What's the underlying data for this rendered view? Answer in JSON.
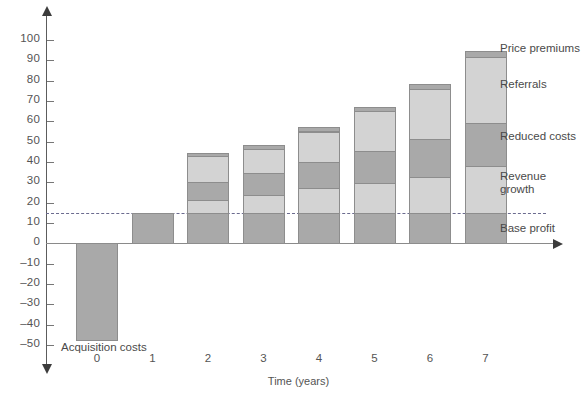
{
  "chart_data": {
    "type": "bar",
    "title": "",
    "subtitle": "",
    "xlabel": "Time (years)",
    "ylabel": "",
    "categories": [
      "0",
      "1",
      "2",
      "3",
      "4",
      "5",
      "6",
      "7"
    ],
    "ylim": [
      -50,
      100
    ],
    "yticks": [
      100,
      90,
      80,
      70,
      60,
      50,
      40,
      30,
      20,
      10,
      0,
      -10,
      -20,
      -30,
      -40,
      -50
    ],
    "ytick_labels": [
      "100",
      "90",
      "80",
      "70",
      "60",
      "50",
      "40",
      "30",
      "20",
      "10",
      "0",
      "–10",
      "–20",
      "–30",
      "–40",
      "–50"
    ],
    "grid": false,
    "legend_position": "right-annotations",
    "stacked": true,
    "reference_line": {
      "value": 15,
      "style": "dashed",
      "color": "#6b6b8f"
    },
    "series": [
      {
        "name": "Acquisition costs",
        "color": "#a9a9a9",
        "values": [
          -48,
          0,
          0,
          0,
          0,
          0,
          0,
          0
        ]
      },
      {
        "name": "Base profit",
        "color": "#a9a9a9",
        "values": [
          0,
          15,
          15,
          15,
          15,
          15,
          15,
          15
        ]
      },
      {
        "name": "Revenue growth",
        "color": "#d3d3d3",
        "values": [
          0,
          0,
          6.5,
          9,
          12,
          14.5,
          17.5,
          23
        ]
      },
      {
        "name": "Reduced costs",
        "color": "#a9a9a9",
        "values": [
          0,
          0,
          8.5,
          10.5,
          13,
          16,
          19,
          21
        ]
      },
      {
        "name": "Referrals",
        "color": "#d3d3d3",
        "values": [
          0,
          0,
          13,
          12,
          15,
          19.5,
          24.5,
          32.5
        ]
      },
      {
        "name": "Price premiums",
        "color": "#a9a9a9",
        "values": [
          0,
          0,
          1.5,
          2,
          2,
          2,
          2.5,
          3
        ]
      }
    ],
    "stack_totals": [
      -48,
      15,
      44.5,
      48.5,
      57,
      67,
      78.5,
      94.5
    ],
    "annotations": [
      {
        "text": "Acquisition costs",
        "anchor": "bar-0-below"
      },
      {
        "text": "Price premiums",
        "anchor": "series-price-premiums"
      },
      {
        "text": "Referrals",
        "anchor": "series-referrals"
      },
      {
        "text": "Reduced costs",
        "anchor": "series-reduced-costs"
      },
      {
        "text": "Revenue\ngrowth",
        "anchor": "series-revenue-growth"
      },
      {
        "text": "Base profit",
        "anchor": "series-base-profit"
      }
    ]
  },
  "colors": {
    "light_segment": "#d3d3d3",
    "dark_segment": "#a9a9a9",
    "segment_border": "#8d8d8d",
    "axis": "#5c5c5c",
    "text": "#4a4a4a",
    "reference_line": "#6b6b8f",
    "background": "#ffffff"
  }
}
